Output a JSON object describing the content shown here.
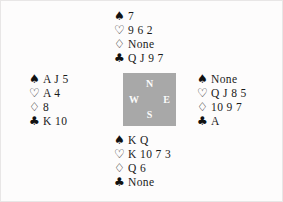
{
  "diagram": {
    "type": "bridge-hand-deal",
    "suit_glyphs": {
      "spades": "♠",
      "hearts": "♡",
      "diamonds": "♢",
      "clubs": "♣"
    },
    "compass": {
      "north": "N",
      "west": "W",
      "east": "E",
      "south": "S",
      "background_color": "#a8a8a8",
      "label_color": "#fbfbfb"
    },
    "hands": {
      "north": {
        "position_label": "North",
        "suits": [
          {
            "name": "spades",
            "symbol": "♠",
            "cards": "7"
          },
          {
            "name": "hearts",
            "symbol": "♡",
            "cards": "9 6 2"
          },
          {
            "name": "diamonds",
            "symbol": "♢",
            "cards": "None"
          },
          {
            "name": "clubs",
            "symbol": "♣",
            "cards": "Q J 9 7"
          }
        ]
      },
      "west": {
        "position_label": "West",
        "suits": [
          {
            "name": "spades",
            "symbol": "♠",
            "cards": "A J 5"
          },
          {
            "name": "hearts",
            "symbol": "♡",
            "cards": "A 4"
          },
          {
            "name": "diamonds",
            "symbol": "♢",
            "cards": "8"
          },
          {
            "name": "clubs",
            "symbol": "♣",
            "cards": "K 10"
          }
        ]
      },
      "east": {
        "position_label": "East",
        "suits": [
          {
            "name": "spades",
            "symbol": "♠",
            "cards": "None"
          },
          {
            "name": "hearts",
            "symbol": "♡",
            "cards": "Q J 8 5"
          },
          {
            "name": "diamonds",
            "symbol": "♢",
            "cards": "10 9 7"
          },
          {
            "name": "clubs",
            "symbol": "♣",
            "cards": "A"
          }
        ]
      },
      "south": {
        "position_label": "South",
        "suits": [
          {
            "name": "spades",
            "symbol": "♠",
            "cards": "K Q"
          },
          {
            "name": "hearts",
            "symbol": "♡",
            "cards": "K 10 7 3"
          },
          {
            "name": "diamonds",
            "symbol": "♢",
            "cards": "Q 6"
          },
          {
            "name": "clubs",
            "symbol": "♣",
            "cards": "None"
          }
        ]
      }
    }
  }
}
